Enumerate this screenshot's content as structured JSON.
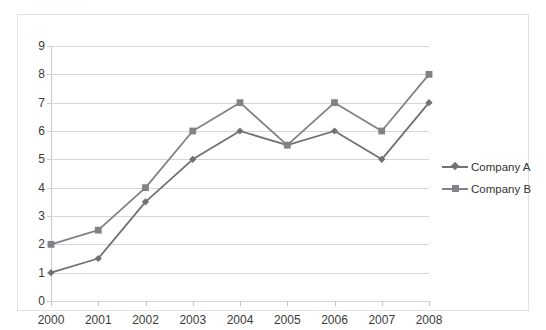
{
  "top_sliver_text": "· ·  ·   ·    ·     ·      ·",
  "legend": {
    "position": "right",
    "entries": [
      {
        "label": "Company A",
        "marker": "diamond-marker-icon",
        "color": "#6f7173"
      },
      {
        "label": "Company B",
        "marker": "square-marker-icon",
        "color": "#808285"
      }
    ]
  },
  "axes": {
    "y_ticks": [
      "0",
      "1",
      "2",
      "3",
      "4",
      "5",
      "6",
      "7",
      "8",
      "9"
    ],
    "x_ticks": [
      "2000",
      "2001",
      "2002",
      "2003",
      "2004",
      "2005",
      "2006",
      "2007",
      "2008"
    ]
  },
  "colors": {
    "series_a": "#6f7173",
    "series_b": "#808285",
    "gridline": "#d6d6d8",
    "axis": "#c9c9cb",
    "frame": "#e2e2e4",
    "text": "#3b3b3b"
  },
  "chart_data": {
    "type": "line",
    "title": "",
    "subtitle": "",
    "xlabel": "",
    "ylabel": "",
    "categories": [
      "2000",
      "2001",
      "2002",
      "2003",
      "2004",
      "2005",
      "2006",
      "2007",
      "2008"
    ],
    "series": [
      {
        "name": "Company A",
        "marker": "diamond",
        "color": "#6f7173",
        "values": [
          1,
          1.5,
          3.5,
          5,
          6,
          5.5,
          6,
          5,
          7
        ]
      },
      {
        "name": "Company B",
        "marker": "square",
        "color": "#808285",
        "values": [
          2,
          2.5,
          4,
          6,
          7,
          5.5,
          7,
          6,
          8
        ]
      }
    ],
    "ylim": [
      0,
      9
    ],
    "ytick_step": 1,
    "grid": "horizontal",
    "legend_position": "right",
    "annotations": []
  }
}
